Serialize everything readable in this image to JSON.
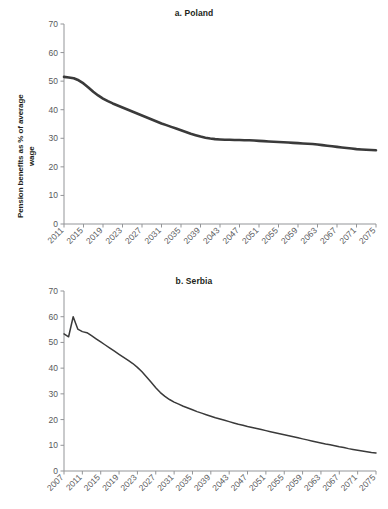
{
  "figure": {
    "ylabel_line1": "Pension benefits as % of average",
    "ylabel_line2": "wage",
    "line_color_poland": "#3a3a3a",
    "line_color_serbia": "#3a3a3a",
    "axis_color": "#939598",
    "tick_label_color": "#58595b"
  },
  "chart_data": [
    {
      "type": "line",
      "title": "a. Poland",
      "xlabel": "",
      "ylabel": "Pension benefits as % of average wage",
      "ylim": [
        0,
        70
      ],
      "yticks": [
        0,
        10,
        20,
        30,
        40,
        50,
        60,
        70
      ],
      "xlim": [
        2011,
        2075
      ],
      "xticks": [
        2011,
        2015,
        2019,
        2023,
        2027,
        2031,
        2035,
        2039,
        2043,
        2047,
        2051,
        2055,
        2059,
        2063,
        2067,
        2071,
        2075
      ],
      "grid": false,
      "legend": null,
      "series": [
        {
          "name": "Poland",
          "x": [
            2011,
            2012,
            2013,
            2014,
            2015,
            2016,
            2017,
            2018,
            2019,
            2020,
            2021,
            2022,
            2023,
            2024,
            2025,
            2026,
            2027,
            2028,
            2029,
            2030,
            2031,
            2032,
            2033,
            2034,
            2035,
            2036,
            2037,
            2038,
            2039,
            2040,
            2041,
            2042,
            2043,
            2044,
            2045,
            2046,
            2047,
            2048,
            2049,
            2050,
            2051,
            2052,
            2053,
            2054,
            2055,
            2056,
            2057,
            2058,
            2059,
            2060,
            2061,
            2062,
            2063,
            2064,
            2065,
            2066,
            2067,
            2068,
            2069,
            2070,
            2071,
            2072,
            2073,
            2074,
            2075
          ],
          "values": [
            51.5,
            51.3,
            51.0,
            50.3,
            49.2,
            47.8,
            46.3,
            45.0,
            43.9,
            43.0,
            42.2,
            41.5,
            40.8,
            40.1,
            39.4,
            38.7,
            38.0,
            37.3,
            36.6,
            35.9,
            35.2,
            34.6,
            34.0,
            33.4,
            32.8,
            32.2,
            31.6,
            31.1,
            30.6,
            30.2,
            29.9,
            29.7,
            29.6,
            29.5,
            29.5,
            29.4,
            29.4,
            29.3,
            29.3,
            29.2,
            29.1,
            29.0,
            28.9,
            28.8,
            28.7,
            28.6,
            28.5,
            28.4,
            28.3,
            28.2,
            28.1,
            28.0,
            27.8,
            27.6,
            27.4,
            27.2,
            27.0,
            26.8,
            26.6,
            26.4,
            26.2,
            26.1,
            26.0,
            25.9,
            25.8
          ]
        }
      ]
    },
    {
      "type": "line",
      "title": "b. Serbia",
      "xlabel": "",
      "ylabel": "Pension benefits as % of average wage",
      "ylim": [
        0,
        70
      ],
      "yticks": [
        0,
        10,
        20,
        30,
        40,
        50,
        60,
        70
      ],
      "xlim": [
        2007,
        2075
      ],
      "xticks": [
        2007,
        2011,
        2015,
        2019,
        2023,
        2027,
        2031,
        2035,
        2039,
        2043,
        2047,
        2051,
        2055,
        2059,
        2063,
        2067,
        2071,
        2075
      ],
      "grid": false,
      "legend": null,
      "series": [
        {
          "name": "Serbia",
          "x": [
            2007,
            2008,
            2009,
            2010,
            2011,
            2012,
            2013,
            2014,
            2015,
            2016,
            2017,
            2018,
            2019,
            2020,
            2021,
            2022,
            2023,
            2024,
            2025,
            2026,
            2027,
            2028,
            2029,
            2030,
            2031,
            2032,
            2033,
            2034,
            2035,
            2036,
            2037,
            2038,
            2039,
            2040,
            2041,
            2042,
            2043,
            2044,
            2045,
            2046,
            2047,
            2048,
            2049,
            2050,
            2051,
            2052,
            2053,
            2054,
            2055,
            2056,
            2057,
            2058,
            2059,
            2060,
            2061,
            2062,
            2063,
            2064,
            2065,
            2066,
            2067,
            2068,
            2069,
            2070,
            2071,
            2072,
            2073,
            2074,
            2075
          ],
          "values": [
            53.3,
            52.2,
            60.0,
            55.2,
            54.2,
            53.8,
            52.6,
            51.4,
            50.2,
            49.0,
            47.8,
            46.6,
            45.4,
            44.2,
            43.0,
            41.8,
            40.3,
            38.6,
            36.6,
            34.5,
            32.4,
            30.5,
            29.0,
            27.8,
            26.8,
            26.0,
            25.2,
            24.5,
            23.8,
            23.1,
            22.5,
            21.9,
            21.3,
            20.7,
            20.2,
            19.7,
            19.2,
            18.7,
            18.2,
            17.8,
            17.3,
            16.9,
            16.5,
            16.1,
            15.7,
            15.3,
            14.9,
            14.5,
            14.1,
            13.7,
            13.3,
            12.9,
            12.5,
            12.1,
            11.7,
            11.3,
            10.9,
            10.5,
            10.2,
            9.8,
            9.4,
            9.1,
            8.7,
            8.4,
            8.1,
            7.8,
            7.5,
            7.2,
            7.0
          ]
        }
      ]
    }
  ]
}
